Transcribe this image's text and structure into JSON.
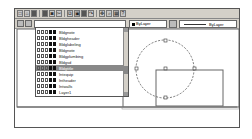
{
  "toolbar": {
    "buttons": [
      {
        "name": "new-icon",
        "glyph": "□"
      },
      {
        "name": "open-icon",
        "glyph": "⌂"
      },
      {
        "name": "save-icon",
        "glyph": "▪"
      },
      {
        "name": "print-icon",
        "glyph": "▤"
      },
      {
        "name": "preview-icon",
        "glyph": "◙"
      },
      {
        "name": "cut-icon",
        "glyph": "✂"
      },
      {
        "name": "copy-icon",
        "glyph": "⧉"
      },
      {
        "name": "paste-icon",
        "glyph": "▣"
      },
      {
        "name": "undo-icon",
        "glyph": "↶"
      },
      {
        "name": "redo-icon",
        "glyph": "↷"
      },
      {
        "name": "pan-icon",
        "glyph": "✥"
      },
      {
        "name": "zoom-icon",
        "glyph": "⌕"
      },
      {
        "name": "properties-icon",
        "glyph": "▦"
      },
      {
        "name": "help-icon",
        "glyph": "?"
      }
    ]
  },
  "properties": {
    "layer_state_icon": "layers-icon",
    "current_layer": "Bldgnote",
    "color_value": "ByLayer",
    "color_swatch": "#000000",
    "linetype_value": "ByLayer"
  },
  "layers": {
    "items": [
      {
        "name": "Bldgnote",
        "selected": false
      },
      {
        "name": "Bldgheader",
        "selected": false
      },
      {
        "name": "Bldglabeling",
        "selected": false
      },
      {
        "name": "Bldgnote",
        "selected": false
      },
      {
        "name": "Bldgplumbing",
        "selected": false
      },
      {
        "name": "Bldgsd",
        "selected": false
      },
      {
        "name": "Bldgtitle",
        "selected": true
      },
      {
        "name": "Intequip",
        "selected": false
      },
      {
        "name": "Intheader",
        "selected": false
      },
      {
        "name": "Intwalls",
        "selected": false
      },
      {
        "name": "Layer1",
        "selected": false
      }
    ]
  },
  "colors": {
    "toolbar_bg": "#d4d0c8",
    "selection": "#888888",
    "drawing_lines": "#666666"
  }
}
